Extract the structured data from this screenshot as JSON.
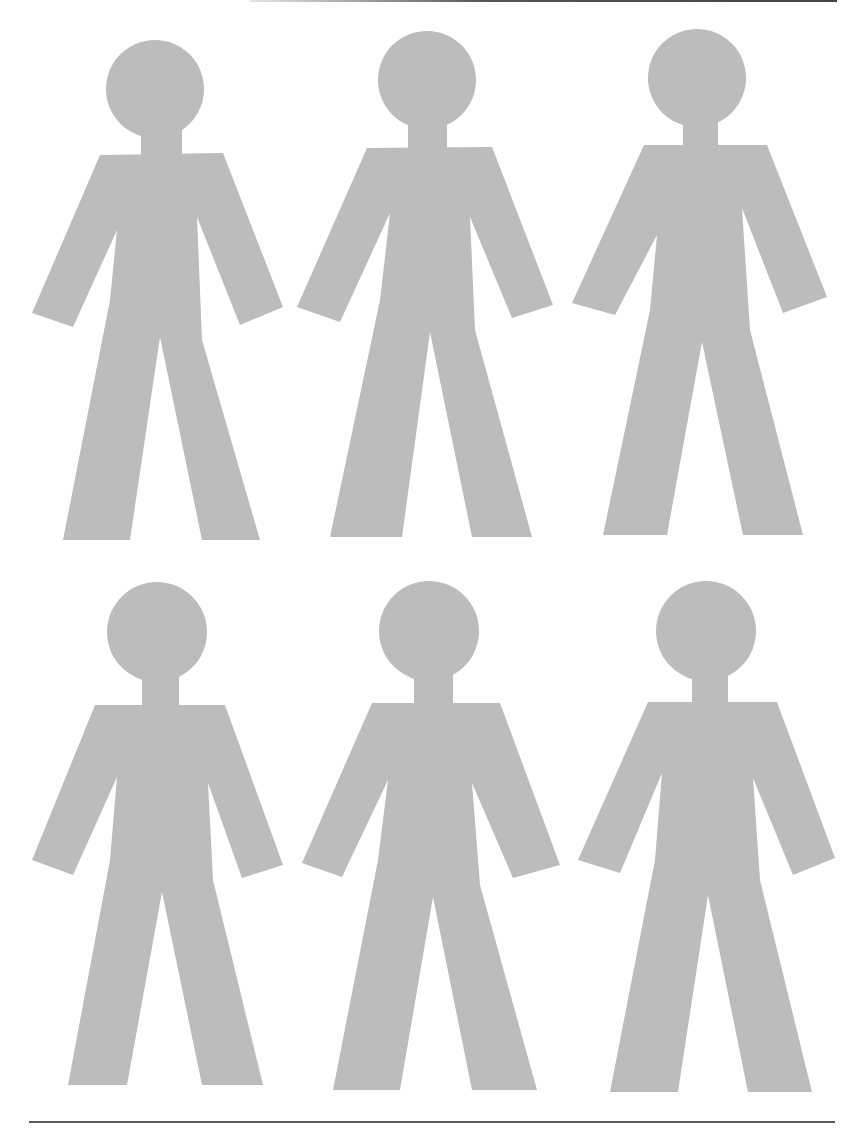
{
  "page": {
    "figure_color": "#bcbcbc",
    "rule_color": "#555555",
    "background": "#ffffff"
  },
  "figures": [
    {
      "id": "figure-1",
      "row": 1,
      "col": 1
    },
    {
      "id": "figure-2",
      "row": 1,
      "col": 2
    },
    {
      "id": "figure-3",
      "row": 1,
      "col": 3
    },
    {
      "id": "figure-4",
      "row": 2,
      "col": 1
    },
    {
      "id": "figure-5",
      "row": 2,
      "col": 2
    },
    {
      "id": "figure-6",
      "row": 2,
      "col": 3
    }
  ]
}
